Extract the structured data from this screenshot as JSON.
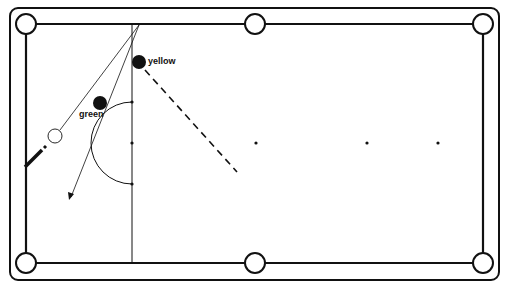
{
  "diagram": {
    "type": "snooker-shot-diagram",
    "balls": [
      {
        "name": "yellow",
        "label": "yellow",
        "x": 139,
        "y": 62,
        "fill": "#111111"
      },
      {
        "name": "green",
        "label": "green",
        "x": 100,
        "y": 103,
        "fill": "#111111"
      },
      {
        "name": "cue-ball",
        "label": "",
        "x": 55,
        "y": 136,
        "fill": "#ffffff"
      }
    ],
    "spots": [
      {
        "name": "brown-spot",
        "x": 132,
        "y": 143
      },
      {
        "name": "blue-spot",
        "x": 256,
        "y": 143
      },
      {
        "name": "pink-spot",
        "x": 367,
        "y": 143
      },
      {
        "name": "black-spot",
        "x": 438,
        "y": 143
      }
    ],
    "colors": {
      "line": "#111111",
      "background": "#ffffff"
    }
  }
}
